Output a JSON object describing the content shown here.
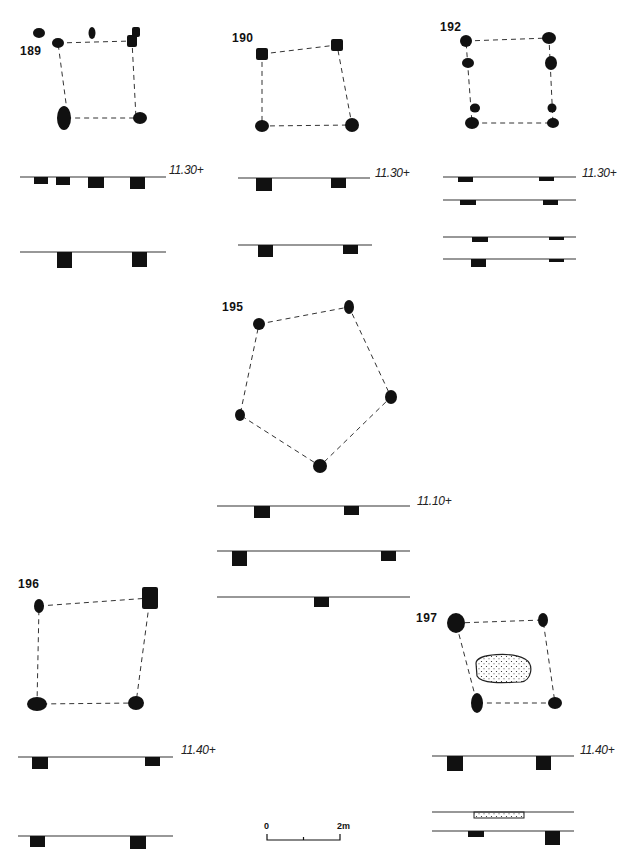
{
  "colors": {
    "ink": "#111111",
    "line": "#333333",
    "paper": "#ffffff"
  },
  "plans": [
    {
      "id": "189",
      "label": "189",
      "label_pos": [
        20,
        44
      ],
      "posts": [
        {
          "x": 58,
          "y": 43,
          "rx": 6,
          "ry": 5
        },
        {
          "x": 132,
          "y": 41,
          "rx": 5,
          "ry": 6,
          "shape": "rect"
        },
        {
          "x": 64,
          "y": 118,
          "rx": 7,
          "ry": 12
        },
        {
          "x": 140,
          "y": 118,
          "rx": 7,
          "ry": 6
        }
      ],
      "extra_posts": [
        {
          "x": 39,
          "y": 33,
          "rx": 6,
          "ry": 5
        },
        {
          "x": 92,
          "y": 33,
          "rx": 3.5,
          "ry": 6
        },
        {
          "x": 136,
          "y": 32,
          "rx": 4,
          "ry": 5,
          "shape": "rect"
        }
      ],
      "outline": [
        [
          58,
          43
        ],
        [
          132,
          41
        ],
        [
          136,
          118
        ],
        [
          68,
          118
        ]
      ]
    },
    {
      "id": "190",
      "label": "190",
      "label_pos": [
        232,
        31
      ],
      "posts": [
        {
          "x": 262,
          "y": 54,
          "rx": 6,
          "ry": 6,
          "shape": "rect"
        },
        {
          "x": 337,
          "y": 45,
          "rx": 6,
          "ry": 6,
          "shape": "rect"
        },
        {
          "x": 352,
          "y": 125,
          "rx": 7,
          "ry": 7
        },
        {
          "x": 262,
          "y": 126,
          "rx": 7,
          "ry": 6
        }
      ],
      "outline": [
        [
          262,
          54
        ],
        [
          337,
          45
        ],
        [
          352,
          125
        ],
        [
          262,
          126
        ]
      ]
    },
    {
      "id": "192",
      "label": "192",
      "label_pos": [
        440,
        20
      ],
      "posts": [
        {
          "x": 466,
          "y": 41,
          "rx": 6,
          "ry": 6
        },
        {
          "x": 549,
          "y": 38,
          "rx": 7,
          "ry": 6
        },
        {
          "x": 468,
          "y": 63,
          "rx": 6,
          "ry": 5
        },
        {
          "x": 551,
          "y": 63,
          "rx": 6,
          "ry": 7
        },
        {
          "x": 475,
          "y": 108,
          "rx": 5,
          "ry": 4.5
        },
        {
          "x": 552,
          "y": 108,
          "rx": 4.5,
          "ry": 4.5
        },
        {
          "x": 472,
          "y": 123,
          "rx": 7,
          "ry": 6
        },
        {
          "x": 553,
          "y": 123,
          "rx": 6,
          "ry": 5
        }
      ],
      "outline": [
        [
          466,
          41
        ],
        [
          549,
          38
        ],
        [
          553,
          123
        ],
        [
          472,
          123
        ]
      ]
    },
    {
      "id": "195",
      "label": "195",
      "label_pos": [
        222,
        300
      ],
      "posts": [
        {
          "x": 259,
          "y": 324,
          "rx": 6,
          "ry": 6
        },
        {
          "x": 349,
          "y": 307,
          "rx": 5,
          "ry": 7
        },
        {
          "x": 391,
          "y": 397,
          "rx": 6,
          "ry": 7
        },
        {
          "x": 320,
          "y": 466,
          "rx": 7,
          "ry": 7
        },
        {
          "x": 240,
          "y": 415,
          "rx": 5,
          "ry": 6
        }
      ],
      "outline": [
        [
          259,
          324
        ],
        [
          349,
          307
        ],
        [
          391,
          397
        ],
        [
          320,
          466
        ],
        [
          240,
          415
        ]
      ]
    },
    {
      "id": "196",
      "label": "196",
      "label_pos": [
        18,
        577
      ],
      "posts": [
        {
          "x": 39,
          "y": 606,
          "rx": 5,
          "ry": 7
        },
        {
          "x": 150,
          "y": 598,
          "rx": 8,
          "ry": 11,
          "shape": "rect"
        },
        {
          "x": 37,
          "y": 704,
          "rx": 10,
          "ry": 7
        },
        {
          "x": 136,
          "y": 703,
          "rx": 8,
          "ry": 7
        }
      ],
      "outline": [
        [
          39,
          606
        ],
        [
          150,
          598
        ],
        [
          136,
          703
        ],
        [
          37,
          704
        ]
      ]
    },
    {
      "id": "197",
      "label": "197",
      "label_pos": [
        416,
        611
      ],
      "posts": [
        {
          "x": 456,
          "y": 623,
          "rx": 9,
          "ry": 10
        },
        {
          "x": 543,
          "y": 620,
          "rx": 5,
          "ry": 7
        },
        {
          "x": 555,
          "y": 703,
          "rx": 7,
          "ry": 6
        },
        {
          "x": 477,
          "y": 703,
          "rx": 6,
          "ry": 10
        }
      ],
      "outline": [
        [
          456,
          623
        ],
        [
          543,
          620
        ],
        [
          555,
          703
        ],
        [
          477,
          703
        ]
      ],
      "hearth": {
        "cx": 503,
        "cy": 669,
        "label": "stippled pit"
      }
    }
  ],
  "sections": [
    {
      "plan": "189",
      "y": 177,
      "x1": 20,
      "x2": 166,
      "elevation": "11.30+",
      "elev_pos": [
        169,
        163
      ],
      "blocks": [
        [
          34,
          14,
          7
        ],
        [
          56,
          14,
          8
        ],
        [
          88,
          16,
          11
        ],
        [
          130,
          15,
          12
        ]
      ]
    },
    {
      "plan": "189",
      "y": 252,
      "x1": 20,
      "x2": 166,
      "blocks": [
        [
          57,
          15,
          16
        ],
        [
          132,
          15,
          15
        ]
      ]
    },
    {
      "plan": "190",
      "y": 178,
      "x1": 238,
      "x2": 370,
      "elevation": "11.30+",
      "elev_pos": [
        375,
        166
      ],
      "blocks": [
        [
          256,
          16,
          13
        ],
        [
          331,
          15,
          10
        ]
      ]
    },
    {
      "plan": "190",
      "y": 245,
      "x1": 238,
      "x2": 372,
      "blocks": [
        [
          258,
          15,
          12
        ],
        [
          343,
          15,
          9
        ]
      ]
    },
    {
      "plan": "192",
      "y": 177,
      "x1": 443,
      "x2": 576,
      "elevation": "11.30+",
      "elev_pos": [
        582,
        166
      ],
      "blocks": [
        [
          458,
          15,
          5
        ],
        [
          539,
          15,
          4
        ]
      ]
    },
    {
      "plan": "192",
      "y": 200,
      "x1": 443,
      "x2": 576,
      "blocks": [
        [
          460,
          16,
          5
        ],
        [
          543,
          15,
          5
        ]
      ]
    },
    {
      "plan": "192",
      "y": 237,
      "x1": 443,
      "x2": 576,
      "blocks": [
        [
          472,
          16,
          5
        ],
        [
          549,
          15,
          3
        ]
      ]
    },
    {
      "plan": "192",
      "y": 259,
      "x1": 443,
      "x2": 576,
      "blocks": [
        [
          471,
          15,
          8
        ],
        [
          549,
          15,
          3
        ]
      ]
    },
    {
      "plan": "195",
      "y": 506,
      "x1": 217,
      "x2": 410,
      "elevation": "11.10+",
      "elev_pos": [
        417,
        494
      ],
      "blocks": [
        [
          254,
          16,
          12
        ],
        [
          344,
          15,
          9
        ]
      ]
    },
    {
      "plan": "195",
      "y": 551,
      "x1": 217,
      "x2": 410,
      "blocks": [
        [
          232,
          15,
          15
        ],
        [
          381,
          15,
          10
        ]
      ]
    },
    {
      "plan": "195",
      "y": 597,
      "x1": 217,
      "x2": 410,
      "blocks": [
        [
          314,
          15,
          10
        ]
      ]
    },
    {
      "plan": "196",
      "y": 757,
      "x1": 18,
      "x2": 173,
      "elevation": "11.40+",
      "elev_pos": [
        181,
        743
      ],
      "blocks": [
        [
          32,
          16,
          12
        ],
        [
          145,
          15,
          9
        ]
      ]
    },
    {
      "plan": "196",
      "y": 836,
      "x1": 18,
      "x2": 173,
      "blocks": [
        [
          30,
          15,
          11
        ],
        [
          130,
          16,
          13
        ]
      ]
    },
    {
      "plan": "197",
      "y": 756,
      "x1": 432,
      "x2": 574,
      "elevation": "11.40+",
      "elev_pos": [
        580,
        743
      ],
      "blocks": [
        [
          447,
          16,
          15
        ],
        [
          536,
          15,
          14
        ]
      ]
    },
    {
      "plan": "197",
      "y": 812,
      "x1": 432,
      "x2": 574,
      "hatched": [
        [
          474,
          50,
          6
        ]
      ]
    },
    {
      "plan": "197",
      "y": 831,
      "x1": 432,
      "x2": 574,
      "blocks": [
        [
          468,
          16,
          6
        ],
        [
          545,
          15,
          14
        ]
      ]
    }
  ],
  "scale_bar": {
    "x1": 267,
    "x2": 340,
    "y": 840,
    "start_label": "0",
    "end_label": "2m",
    "mid_tick": true
  }
}
